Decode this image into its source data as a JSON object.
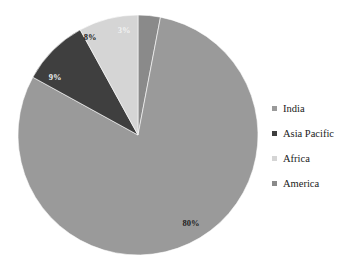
{
  "chart_data": {
    "type": "pie",
    "title": "",
    "start_angle": 0,
    "direction": "clockwise",
    "legend_position": "right",
    "grid": false,
    "labels_on_slices": true,
    "categories": [
      "India",
      "Asia Pacific",
      "Africa",
      "America"
    ],
    "values": [
      80,
      9,
      8,
      3
    ],
    "value_labels": [
      "80%",
      "9%",
      "8%",
      "3%"
    ],
    "colors": [
      "#9a9a9a",
      "#3f3f3f",
      "#d5d5d5",
      "#8a8a8a"
    ],
    "slice_order_clockwise_from_top": [
      "America",
      "India",
      "Asia Pacific",
      "Africa"
    ],
    "slices": [
      {
        "name": "America",
        "value": 3,
        "label": "3%",
        "color": "#8a8a8a",
        "label_color": "#f2f2f2",
        "label_x": 124,
        "label_y": 33
      },
      {
        "name": "India",
        "value": 80,
        "label": "80%",
        "color": "#9a9a9a",
        "label_color": "#222222",
        "label_x": 191,
        "label_y": 226
      },
      {
        "name": "Asia Pacific",
        "value": 9,
        "label": "9%",
        "color": "#3f3f3f",
        "label_color": "#f2f2f2",
        "label_x": 55,
        "label_y": 80
      },
      {
        "name": "Africa",
        "value": 8,
        "label": "8%",
        "color": "#d5d5d5",
        "label_color": "#222222",
        "label_x": 90,
        "label_y": 40
      }
    ],
    "geometry": {
      "center_x": 138,
      "center_y": 135,
      "radius": 120
    }
  },
  "legend": {
    "items": [
      {
        "label": "India",
        "marker_color": "#9a9a9a"
      },
      {
        "label": "Asia Pacific",
        "marker_color": "#3f3f3f"
      },
      {
        "label": "Africa",
        "marker_color": "#d5d5d5"
      },
      {
        "label": "America",
        "marker_color": "#8a8a8a"
      }
    ]
  }
}
